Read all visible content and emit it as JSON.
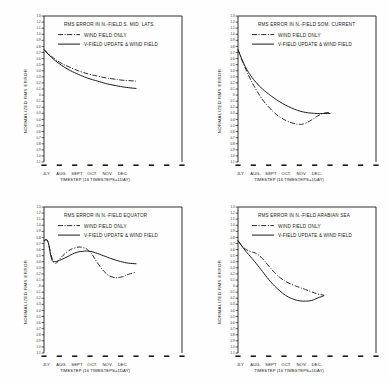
{
  "figure": {
    "background": "#fefefe",
    "ink": "#1a1a1a",
    "panel_count": 4
  },
  "common": {
    "ylabel": "NORMALIZED RMS ERROR",
    "xlabel": "TIMESTEP (16 TIMESTEPS=1DAY)",
    "xticklabels": [
      "JLY",
      "AUG.",
      "SEPT",
      "OCT.",
      "NOV.",
      "DEC."
    ],
    "yticklabels": [
      "1.3",
      "1.2",
      "1.1",
      "1.0",
      "0.9",
      "0.8",
      "0.7",
      "0.6",
      "0.5",
      "0.4",
      "0.3",
      "0.2",
      "0.1",
      "0",
      "0.1",
      "0.2",
      "0.3",
      "0.4",
      "0.5",
      "0.6",
      "0.7",
      "0.8",
      "0.9",
      "1.0",
      "1.1"
    ],
    "legend": [
      {
        "label": "WIND FIELD ONLY",
        "style": "dash-dot"
      },
      {
        "label": "V-FIELD UPDATE & WIND FIELD",
        "style": "solid"
      }
    ]
  },
  "chart_data": [
    {
      "type": "line",
      "panel": "top-left",
      "title": "RMS ERROR IN N.-FIELD S. MID. LATS.",
      "xlabel": "TIMESTEP (16 TIMESTEPS=1DAY)",
      "ylabel": "NORMALIZED RMS ERROR",
      "x": [
        "JLY",
        "AUG.",
        "SEPT",
        "OCT.",
        "NOV.",
        "DEC."
      ],
      "xlim": [
        0,
        9
      ],
      "ylim": [
        0.0,
        1.3
      ],
      "grid": false,
      "legend_position": "upper-left-inside",
      "series": [
        {
          "name": "WIND FIELD ONLY",
          "style": "dash-dot",
          "x": [
            0.0,
            0.5,
            1.0,
            1.5,
            2.0,
            2.5,
            3.0,
            3.5,
            4.0,
            4.5,
            5.0,
            5.5,
            6.0
          ],
          "values": [
            1.0,
            0.94,
            0.89,
            0.855,
            0.825,
            0.8,
            0.78,
            0.765,
            0.75,
            0.74,
            0.73,
            0.725,
            0.72
          ]
        },
        {
          "name": "V-FIELD UPDATE & WIND FIELD",
          "style": "solid",
          "x": [
            0.0,
            0.5,
            1.0,
            1.5,
            2.0,
            2.5,
            3.0,
            3.5,
            4.0,
            4.5,
            5.0,
            5.5,
            6.0
          ],
          "values": [
            1.0,
            0.93,
            0.875,
            0.83,
            0.795,
            0.765,
            0.74,
            0.72,
            0.7,
            0.685,
            0.672,
            0.662,
            0.655
          ]
        }
      ]
    },
    {
      "type": "line",
      "panel": "top-right",
      "title": "RMS ERROR IN N.-FIELD SOM. CURRENT",
      "xlabel": "TIMESTEP (16 TIMESTEPS=1DAY)",
      "ylabel": "NORMALIZED RMS ERROR",
      "x": [
        "JLY",
        "AUG.",
        "SEPT",
        "OCT.",
        "NOV.",
        "DEC."
      ],
      "xlim": [
        0,
        9
      ],
      "ylim": [
        0.0,
        1.3
      ],
      "grid": false,
      "legend_position": "upper-left-inside",
      "series": [
        {
          "name": "WIND FIELD ONLY",
          "style": "dash-dot",
          "x": [
            0.0,
            0.4,
            0.8,
            1.2,
            1.6,
            2.0,
            2.4,
            2.8,
            3.2,
            3.6,
            4.0,
            4.4,
            4.8,
            5.2,
            5.6,
            6.0
          ],
          "values": [
            1.0,
            0.86,
            0.74,
            0.64,
            0.555,
            0.49,
            0.435,
            0.395,
            0.365,
            0.345,
            0.335,
            0.345,
            0.375,
            0.41,
            0.435,
            0.44
          ]
        },
        {
          "name": "V-FIELD UPDATE & WIND FIELD",
          "style": "solid",
          "x": [
            0.0,
            0.4,
            0.8,
            1.2,
            1.6,
            2.0,
            2.4,
            2.8,
            3.2,
            3.6,
            4.0,
            4.4,
            4.8,
            5.2,
            5.6,
            6.0
          ],
          "values": [
            1.0,
            0.87,
            0.775,
            0.705,
            0.65,
            0.605,
            0.565,
            0.53,
            0.5,
            0.475,
            0.455,
            0.442,
            0.435,
            0.432,
            0.432,
            0.432
          ]
        }
      ]
    },
    {
      "type": "line",
      "panel": "bottom-left",
      "title": "RMS ERROR IN N.-FIELD EQUATOR",
      "xlabel": "TIMESTEP (16 TIMESTEPS=1DAY)",
      "ylabel": "NORMALIZED RMS ERROR",
      "x": [
        "JLY",
        "AUG.",
        "SEPT",
        "OCT.",
        "NOV.",
        "DEC."
      ],
      "xlim": [
        0,
        9
      ],
      "ylim": [
        0.0,
        1.3
      ],
      "grid": false,
      "legend_position": "upper-left-inside",
      "series": [
        {
          "name": "WIND FIELD ONLY",
          "style": "dash-dot",
          "x": [
            0.0,
            0.25,
            0.5,
            0.75,
            1.0,
            1.5,
            2.0,
            2.5,
            3.0,
            3.5,
            4.0,
            4.5,
            5.0,
            5.5,
            6.0
          ],
          "values": [
            1.0,
            0.99,
            0.855,
            0.8,
            0.835,
            0.9,
            0.935,
            0.94,
            0.9,
            0.8,
            0.715,
            0.675,
            0.675,
            0.7,
            0.72
          ]
        },
        {
          "name": "V-FIELD UPDATE & WIND FIELD",
          "style": "solid",
          "x": [
            0.0,
            0.25,
            0.5,
            0.75,
            1.0,
            1.5,
            2.0,
            2.5,
            3.0,
            3.5,
            4.0,
            4.5,
            5.0,
            5.5,
            6.0
          ],
          "values": [
            1.0,
            0.995,
            0.835,
            0.815,
            0.825,
            0.855,
            0.89,
            0.905,
            0.905,
            0.885,
            0.86,
            0.835,
            0.815,
            0.8,
            0.795
          ]
        }
      ]
    },
    {
      "type": "line",
      "panel": "bottom-right",
      "title": "RMS ERROR IN N.-FIELD ARABIAN SEA",
      "xlabel": "TIMESTEP (16 TIMESTEPS=1DAY)",
      "ylabel": "NORMALIZED RMS ERROR",
      "x": [
        "JLY",
        "AUG.",
        "SEPT",
        "OCT.",
        "NOV.",
        "DEC."
      ],
      "xlim": [
        0,
        9
      ],
      "ylim": [
        0.0,
        1.3
      ],
      "grid": false,
      "legend_position": "upper-left-inside",
      "series": [
        {
          "name": "WIND FIELD ONLY",
          "style": "dash-dot",
          "x": [
            0.0,
            0.4,
            0.8,
            1.2,
            1.6,
            2.0,
            2.4,
            2.8,
            3.2,
            3.6,
            4.0,
            4.4,
            4.8,
            5.2,
            5.6
          ],
          "values": [
            1.0,
            0.935,
            0.905,
            0.885,
            0.84,
            0.775,
            0.715,
            0.665,
            0.63,
            0.605,
            0.585,
            0.565,
            0.545,
            0.525,
            0.515
          ]
        },
        {
          "name": "V-FIELD UPDATE & WIND FIELD",
          "style": "solid",
          "x": [
            0.0,
            0.4,
            0.8,
            1.2,
            1.6,
            2.0,
            2.4,
            2.8,
            3.2,
            3.6,
            4.0,
            4.4,
            4.8,
            5.2,
            5.6
          ],
          "values": [
            1.0,
            0.925,
            0.86,
            0.795,
            0.725,
            0.655,
            0.595,
            0.545,
            0.505,
            0.48,
            0.465,
            0.462,
            0.468,
            0.49,
            0.51
          ]
        }
      ]
    }
  ]
}
